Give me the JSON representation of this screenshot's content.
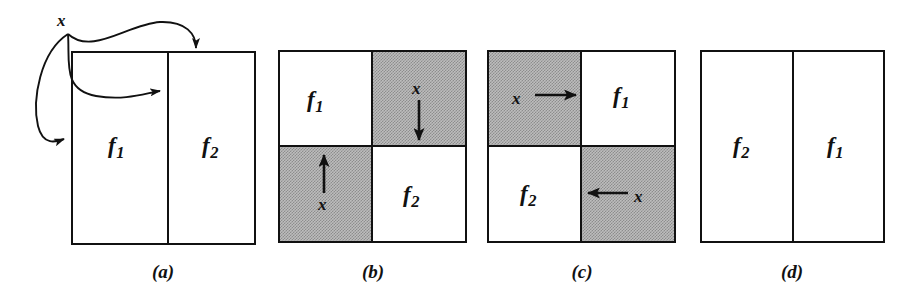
{
  "figure": {
    "background_color": "#ffffff",
    "line_color": "#111111",
    "shade_color": "#bdbdbd"
  },
  "panels": [
    {
      "id": "a",
      "caption": "(a)",
      "layout": "two-vertical-columns",
      "cells": [
        {
          "label": "f",
          "subscript": "1",
          "shaded": false,
          "position": "left"
        },
        {
          "label": "f",
          "subscript": "2",
          "shaded": false,
          "position": "right"
        }
      ],
      "annotations": [
        {
          "name": "x",
          "text": "x",
          "kind": "temp-variable-label"
        },
        {
          "name": "curve-to-top-right",
          "kind": "curved-arrow",
          "from": "x",
          "to": "top-edge-right-column"
        },
        {
          "name": "curve-to-divider",
          "kind": "curved-arrow",
          "from": "x",
          "to": "column-divider"
        },
        {
          "name": "curve-to-left-edge",
          "kind": "curved-arrow",
          "from": "x",
          "to": "left-edge"
        }
      ]
    },
    {
      "id": "b",
      "caption": "(b)",
      "layout": "two-by-two-quadrants",
      "cells": [
        {
          "label": "f",
          "subscript": "1",
          "shaded": false,
          "position": "top-left"
        },
        {
          "label": "x",
          "shaded": true,
          "position": "top-right",
          "arrow": "down"
        },
        {
          "label": "x",
          "shaded": true,
          "position": "bottom-left",
          "arrow": "up"
        },
        {
          "label": "f",
          "subscript": "2",
          "shaded": false,
          "position": "bottom-right"
        }
      ]
    },
    {
      "id": "c",
      "caption": "(c)",
      "layout": "two-by-two-quadrants",
      "cells": [
        {
          "label": "x",
          "shaded": true,
          "position": "top-left",
          "arrow": "right"
        },
        {
          "label": "f",
          "subscript": "1",
          "shaded": false,
          "position": "top-right"
        },
        {
          "label": "f",
          "subscript": "2",
          "shaded": false,
          "position": "bottom-left"
        },
        {
          "label": "x",
          "shaded": true,
          "position": "bottom-right",
          "arrow": "left"
        }
      ]
    },
    {
      "id": "d",
      "caption": "(d)",
      "layout": "two-vertical-columns",
      "cells": [
        {
          "label": "f",
          "subscript": "2",
          "shaded": false,
          "position": "left"
        },
        {
          "label": "f",
          "subscript": "1",
          "shaded": false,
          "position": "right"
        }
      ]
    }
  ],
  "labels": {
    "f1_base": "f",
    "f1_sub": "1",
    "f2_base": "f",
    "f2_sub": "2",
    "x": "x",
    "caption_a": "(a)",
    "caption_b": "(b)",
    "caption_c": "(c)",
    "caption_d": "(d)"
  }
}
